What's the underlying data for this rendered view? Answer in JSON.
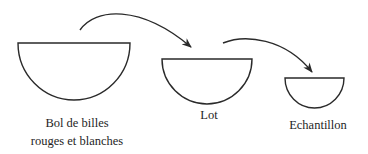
{
  "diagram": {
    "nodes": [
      {
        "id": "bowl",
        "label_line1": "Bol de billes",
        "label_line2": "rouges et blanches"
      },
      {
        "id": "lot",
        "label_line1": "Lot"
      },
      {
        "id": "sample",
        "label_line1": "Echantillon"
      }
    ],
    "edges": [
      {
        "from": "bowl",
        "to": "lot"
      },
      {
        "from": "lot",
        "to": "sample"
      }
    ],
    "colors": {
      "stroke": "#2a2a2a",
      "background": "#ffffff"
    }
  }
}
